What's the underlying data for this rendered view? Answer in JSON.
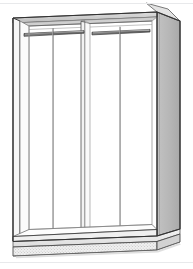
{
  "document": {
    "title": "Wardrobe Cabinet",
    "subject": "two-door double-compartment wardrobe carcass",
    "view": "three-quarter isometric perspective",
    "rule_color": "#e8e9eb"
  },
  "canvas": {
    "width": 193,
    "height": 269,
    "background": "#ffffff"
  },
  "palette": {
    "outline": "#3a3a3a",
    "outline_light": "#8d8d8d",
    "hairline": "#b4b4b4",
    "side_panel_fill": "#b9b9b9",
    "side_panel_fill_dark": "#a8a8a8",
    "top_panel_fill": "#d4d4d4",
    "top_panel_fill_dark": "#bdbdbd",
    "interior_fill": "#ffffff",
    "plinth_fill": "#e6e6e6",
    "plinth_face_fill": "#efefef",
    "plinth_stipple": "#9a9a9a",
    "rail_fill": "#6f6f6f",
    "rail_highlight": "#cfcfcf",
    "divider_fill": "#f2f2f2",
    "shadow_fill": "#cccccc"
  },
  "parts": [
    {
      "id": "top-panel",
      "name": "Top panel",
      "kind": "horizontal board",
      "visible_face": "underside and front edge"
    },
    {
      "id": "right-side-panel",
      "name": "Right side panel",
      "kind": "vertical board",
      "fill": "#b9b9b9"
    },
    {
      "id": "left-side-panel",
      "name": "Left side panel",
      "kind": "vertical board",
      "fill": "#ffffff"
    },
    {
      "id": "center-divider",
      "name": "Center divider panel",
      "kind": "vertical board"
    },
    {
      "id": "bottom-panel",
      "name": "Bottom panel",
      "kind": "horizontal board"
    },
    {
      "id": "plinth",
      "name": "Plinth base",
      "kind": "recessed base",
      "texture": "stipple"
    },
    {
      "id": "back-panel",
      "name": "Back panel",
      "kind": "rear board"
    }
  ],
  "compartments": [
    {
      "id": "left-compartment",
      "name": "Left hanging compartment",
      "rail": {
        "id": "left-hanging-rail",
        "name": "Left hanging rail",
        "support": "left-rail-support",
        "orientation": "front-to-back"
      }
    },
    {
      "id": "right-compartment",
      "name": "Right hanging compartment",
      "rail": {
        "id": "right-hanging-rail",
        "name": "Right hanging rail",
        "support": "right-rail-support",
        "orientation": "front-to-back"
      }
    }
  ],
  "labels": {
    "none_visible": ""
  }
}
